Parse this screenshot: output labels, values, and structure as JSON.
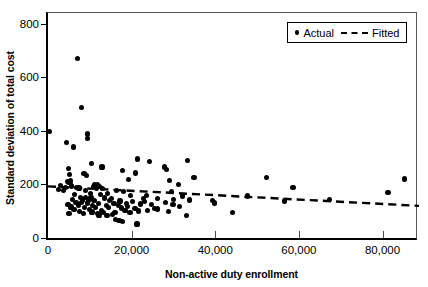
{
  "chart_data": {
    "type": "scatter",
    "title": "",
    "xlabel": "Non-active duty enrollment",
    "ylabel": "Standard deviation of total cost",
    "xlim": [
      0,
      88000
    ],
    "ylim": [
      0,
      840
    ],
    "xticks": [
      0,
      20000,
      40000,
      60000,
      80000
    ],
    "xtick_labels": [
      "0",
      "20,000",
      "40,000",
      "60,000",
      "80,000"
    ],
    "yticks": [
      0,
      200,
      400,
      600,
      800
    ],
    "ytick_labels": [
      "0",
      "200",
      "400",
      "600",
      "800"
    ],
    "grid": false,
    "legend_position": "top-right",
    "series": [
      {
        "name": "Actual",
        "marker": "filled-circle",
        "color": "#000000",
        "points": [
          [
            300,
            398
          ],
          [
            7100,
            670
          ],
          [
            8100,
            487
          ],
          [
            9500,
            388
          ],
          [
            9500,
            371
          ],
          [
            4400,
            357
          ],
          [
            6100,
            340
          ],
          [
            21400,
            295
          ],
          [
            33400,
            289
          ],
          [
            24200,
            285
          ],
          [
            10400,
            277
          ],
          [
            27900,
            265
          ],
          [
            12900,
            265
          ],
          [
            4900,
            258
          ],
          [
            28300,
            255
          ],
          [
            17900,
            251
          ],
          [
            21000,
            243
          ],
          [
            8600,
            240
          ],
          [
            5100,
            236
          ],
          [
            9200,
            232
          ],
          [
            34900,
            225
          ],
          [
            52200,
            227
          ],
          [
            85200,
            220
          ],
          [
            19300,
            218
          ],
          [
            29100,
            214
          ],
          [
            5300,
            213
          ],
          [
            4600,
            212
          ],
          [
            4900,
            208
          ],
          [
            31200,
            201
          ],
          [
            11200,
            200
          ],
          [
            11800,
            199
          ],
          [
            58600,
            190
          ],
          [
            3000,
            196
          ],
          [
            5700,
            194
          ],
          [
            10800,
            193
          ],
          [
            12300,
            192
          ],
          [
            6900,
            190
          ],
          [
            4200,
            189
          ],
          [
            7400,
            187
          ],
          [
            11600,
            186
          ],
          [
            13100,
            184
          ],
          [
            81300,
            171
          ],
          [
            2600,
            180
          ],
          [
            8900,
            178
          ],
          [
            3800,
            176
          ],
          [
            16300,
            176
          ],
          [
            18100,
            175
          ],
          [
            29600,
            174
          ],
          [
            47700,
            157
          ],
          [
            10100,
            166
          ],
          [
            14200,
            165
          ],
          [
            6400,
            162
          ],
          [
            12600,
            161
          ],
          [
            19700,
            160
          ],
          [
            23500,
            158
          ],
          [
            32200,
            157
          ],
          [
            67300,
            143
          ],
          [
            56600,
            138
          ],
          [
            7800,
            152
          ],
          [
            9000,
            151
          ],
          [
            10300,
            150
          ],
          [
            13500,
            149
          ],
          [
            15100,
            148
          ],
          [
            22800,
            147
          ],
          [
            26200,
            146
          ],
          [
            30100,
            145
          ],
          [
            39400,
            140
          ],
          [
            39900,
            131
          ],
          [
            5900,
            143
          ],
          [
            8300,
            142
          ],
          [
            9700,
            141
          ],
          [
            11000,
            140
          ],
          [
            14800,
            139
          ],
          [
            17200,
            138
          ],
          [
            20300,
            137
          ],
          [
            23100,
            136
          ],
          [
            28100,
            134
          ],
          [
            33900,
            142
          ],
          [
            6700,
            133
          ],
          [
            8000,
            132
          ],
          [
            9400,
            131
          ],
          [
            12000,
            130
          ],
          [
            15800,
            129
          ],
          [
            18700,
            128
          ],
          [
            22100,
            127
          ],
          [
            24700,
            126
          ],
          [
            29900,
            125
          ],
          [
            4800,
            124
          ],
          [
            7200,
            123
          ],
          [
            10700,
            122
          ],
          [
            13900,
            121
          ],
          [
            16900,
            120
          ],
          [
            19000,
            119
          ],
          [
            25400,
            110
          ],
          [
            26100,
            108
          ],
          [
            31500,
            118
          ],
          [
            5500,
            116
          ],
          [
            8800,
            115
          ],
          [
            11400,
            114
          ],
          [
            14500,
            113
          ],
          [
            17600,
            112
          ],
          [
            20800,
            111
          ],
          [
            23800,
            103
          ],
          [
            6200,
            106
          ],
          [
            9900,
            105
          ],
          [
            12700,
            104
          ],
          [
            18400,
            102
          ],
          [
            21700,
            101
          ],
          [
            28900,
            100
          ],
          [
            44200,
            96
          ],
          [
            33100,
            85
          ],
          [
            7600,
            98
          ],
          [
            10500,
            97
          ],
          [
            13300,
            96
          ],
          [
            16000,
            95
          ],
          [
            19600,
            94
          ],
          [
            5000,
            92
          ],
          [
            8400,
            91
          ],
          [
            11900,
            90
          ],
          [
            15400,
            89
          ],
          [
            17000,
            65
          ],
          [
            17800,
            62
          ],
          [
            16100,
            68
          ],
          [
            21300,
            52
          ],
          [
            12200,
            86
          ],
          [
            14100,
            84
          ]
        ]
      },
      {
        "name": "Fitted",
        "marker": "dashed-line",
        "color": "#000000",
        "line": [
          [
            0,
            200
          ],
          [
            88000,
            128
          ]
        ]
      }
    ],
    "legend": [
      {
        "label": "Actual",
        "marker": "filled-circle"
      },
      {
        "label": "Fitted",
        "marker": "dashed-line"
      }
    ]
  }
}
